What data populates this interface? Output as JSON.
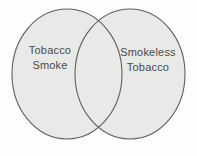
{
  "figure": {
    "background_color": "#fdfdfc",
    "venn": {
      "fill_color": "#e9e9e7",
      "stroke_color": "#5e5e5e",
      "label_color": "#4a4a4a",
      "left_set": {
        "label": "Tobacco Smoke",
        "label_line1": "Tobacco",
        "label_line2": "Smoke"
      },
      "right_set": {
        "label": "Smokeless Tobacco",
        "label_line1": "Smokeless",
        "label_line2": "Tobacco"
      },
      "overlap": {
        "label": ""
      }
    }
  }
}
